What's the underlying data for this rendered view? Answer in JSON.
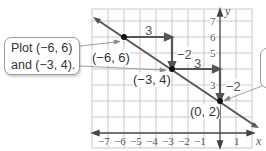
{
  "callout_left": {
    "line1": "Plot (−6, 6)",
    "line2": "and (−3, 4)."
  },
  "axes": {
    "x_label": "x",
    "y_label": "y",
    "x_ticks": [
      "−7",
      "−6",
      "−5",
      "−4",
      "−3",
      "−2",
      "−1",
      "1"
    ],
    "y_ticks": [
      "7",
      "6",
      "5",
      "3"
    ]
  },
  "points": [
    {
      "label": "(−6, 6)",
      "x": -6,
      "y": 6
    },
    {
      "label": "(−3, 4)",
      "x": -3,
      "y": 4
    },
    {
      "label": "(0, 2)",
      "x": 0,
      "y": 2
    }
  ],
  "slope_steps": [
    {
      "run_label": "3",
      "rise_label": "−2"
    },
    {
      "run_label": "3",
      "rise_label": "−2"
    }
  ],
  "colors": {
    "line": "#555555",
    "grid": "#c8c8c8",
    "axis": "#444444",
    "point": "#111111"
  }
}
